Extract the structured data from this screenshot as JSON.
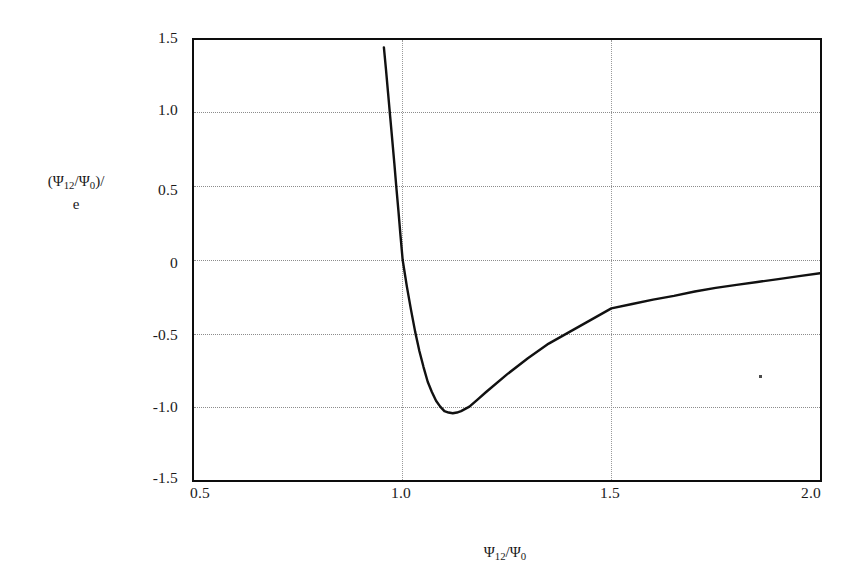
{
  "figure": {
    "background_color": "#ffffff",
    "frame_color": "#0d0d0d",
    "curve_color": "#111111",
    "gridline_color": "#8c8c8c"
  },
  "axis_titles": {
    "y_line1_prefix": "(Ψ",
    "y_line1_sub1": "12",
    "y_line1_mid": "/Ψ",
    "y_line1_sub2": "0",
    "y_line1_suffix": ")/",
    "y_line2": "e",
    "x_prefix": "Ψ",
    "x_sub1": "12",
    "x_mid": "/Ψ",
    "x_sub2": "0"
  },
  "chart_data": {
    "type": "line",
    "title": "",
    "subtitle": "",
    "xlabel": "Ψ₁₂/Ψ₀",
    "ylabel": "(Ψ₁₂/Ψ₀)/e",
    "xlim": [
      0.5,
      2.0
    ],
    "ylim": [
      -1.5,
      1.5
    ],
    "xticks": [
      0.5,
      1.0,
      1.5,
      2.0
    ],
    "xtick_labels": [
      "0.5",
      "1.0",
      "1.5",
      "2.0"
    ],
    "yticks": [
      1.5,
      1.0,
      0.5,
      0,
      -0.5,
      -1.0,
      -1.5
    ],
    "ytick_labels": [
      "1.5",
      "1.0",
      "0.5",
      "0",
      "-0.5",
      "-1.0",
      "-1.5"
    ],
    "grid": true,
    "grid_style": "dotted",
    "grid_axes": "both",
    "legend": null,
    "legend_position": "none",
    "series": [
      {
        "name": "(Ψ₁₂/Ψ₀)/e",
        "note": "steeply descending branch with near-vertical asymptote just below x=1.0, zero crossing at x=1.00, minimum about -1.04 near x=1.12, then monotonic rise approaching -0.09 at x=2.0",
        "x": [
          0.955,
          0.96,
          0.965,
          0.97,
          0.975,
          0.98,
          0.985,
          0.99,
          0.995,
          1.0,
          1.01,
          1.02,
          1.03,
          1.04,
          1.05,
          1.06,
          1.07,
          1.08,
          1.09,
          1.1,
          1.11,
          1.12,
          1.13,
          1.14,
          1.16,
          1.18,
          1.2,
          1.25,
          1.3,
          1.35,
          1.4,
          1.45,
          1.5,
          1.55,
          1.6,
          1.65,
          1.7,
          1.75,
          1.8,
          1.85,
          1.9,
          1.95,
          2.0
        ],
        "y": [
          1.45,
          1.3,
          1.14,
          0.98,
          0.82,
          0.66,
          0.49,
          0.33,
          0.16,
          0.0,
          -0.18,
          -0.34,
          -0.49,
          -0.62,
          -0.73,
          -0.83,
          -0.9,
          -0.96,
          -1.0,
          -1.03,
          -1.04,
          -1.045,
          -1.04,
          -1.03,
          -1.0,
          -0.95,
          -0.9,
          -0.78,
          -0.67,
          -0.57,
          -0.49,
          -0.41,
          -0.33,
          -0.3,
          -0.27,
          -0.245,
          -0.215,
          -0.19,
          -0.17,
          -0.15,
          -0.13,
          -0.11,
          -0.09
        ]
      }
    ]
  },
  "annotations": {
    "scan_speck": "scanner-artifact-dot"
  }
}
